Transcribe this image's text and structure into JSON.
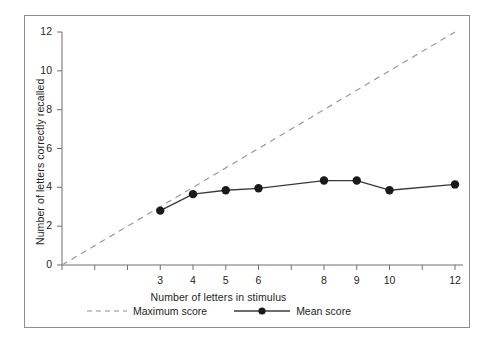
{
  "chart_data": {
    "type": "line",
    "title": "",
    "xlabel": "Number of letters in stimulus",
    "ylabel": "Number of letters correctly recalled",
    "xlim": [
      0,
      12.6
    ],
    "ylim": [
      0,
      12
    ],
    "grid": false,
    "legend_position": "bottom-center",
    "x_ticks": [
      0,
      1,
      2,
      3,
      4,
      5,
      6,
      7,
      8,
      9,
      10,
      11,
      12
    ],
    "x_tick_labels": [
      "",
      "",
      "",
      "3",
      "4",
      "5",
      "6",
      "",
      "8",
      "9",
      "10",
      "",
      "12"
    ],
    "y_ticks": [
      0,
      2,
      4,
      6,
      8,
      10,
      12
    ],
    "y_tick_labels": [
      "0",
      "2",
      "4",
      "6",
      "8",
      "10",
      "12"
    ],
    "series": [
      {
        "name": "Maximum score",
        "style": "dashed",
        "color": "#9a9a9a",
        "markers": false,
        "x": [
          0,
          12
        ],
        "values": [
          0,
          12
        ]
      },
      {
        "name": "Mean score",
        "style": "solid",
        "color": "#3a3a3a",
        "markers": true,
        "marker_color": "#1a1a1a",
        "x": [
          3,
          4,
          5,
          6,
          8,
          9,
          10,
          12
        ],
        "values": [
          2.8,
          3.65,
          3.85,
          3.95,
          4.35,
          4.35,
          3.85,
          4.15
        ]
      }
    ]
  },
  "legend": {
    "items": [
      {
        "label": "Maximum score",
        "swatch": "dashed-line-swatch"
      },
      {
        "label": "Mean score",
        "swatch": "solid-line-dot-swatch"
      }
    ]
  },
  "colors": {
    "frame": "#8d8d8d",
    "axis": "#6f6f6f",
    "text": "#231f20",
    "maximum_score": "#9a9a9a",
    "mean_score": "#3a3a3a"
  }
}
